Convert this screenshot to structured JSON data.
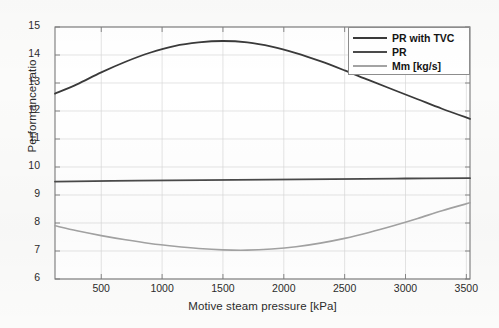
{
  "chart_data": {
    "type": "line",
    "title": "",
    "xlabel": "Motive steam pressure [kPa]",
    "ylabel": "Performance ratio",
    "xlim": [
      120,
      3530
    ],
    "ylim": [
      6,
      15
    ],
    "xticks": [
      500,
      1000,
      1500,
      2000,
      2500,
      3000,
      3500
    ],
    "yticks": [
      6,
      7,
      8,
      9,
      10,
      11,
      12,
      13,
      14,
      15
    ],
    "grid": true,
    "legend_position": "upper right",
    "series": [
      {
        "name": "PR with TVC",
        "color": "#3a3a3a",
        "width": 1.8,
        "x": [
          120,
          300,
          500,
          700,
          900,
          1100,
          1300,
          1500,
          1700,
          1900,
          2100,
          2300,
          2500,
          2700,
          2900,
          3100,
          3300,
          3530
        ],
        "y": [
          12.62,
          12.95,
          13.38,
          13.76,
          14.08,
          14.32,
          14.45,
          14.5,
          14.45,
          14.3,
          14.07,
          13.78,
          13.45,
          13.1,
          12.76,
          12.42,
          12.08,
          11.72
        ]
      },
      {
        "name": "PR",
        "color": "#4a4a4a",
        "width": 1.8,
        "x": [
          120,
          800,
          1600,
          2400,
          3000,
          3530
        ],
        "y": [
          9.48,
          9.51,
          9.54,
          9.57,
          9.59,
          9.6
        ]
      },
      {
        "name": "Mm [kg/s]",
        "color": "#a3a3a3",
        "width": 1.6,
        "x": [
          120,
          300,
          500,
          700,
          900,
          1100,
          1300,
          1500,
          1700,
          1900,
          2100,
          2300,
          2500,
          2700,
          2900,
          3100,
          3300,
          3530
        ],
        "y": [
          7.9,
          7.72,
          7.55,
          7.4,
          7.27,
          7.17,
          7.09,
          7.04,
          7.03,
          7.07,
          7.15,
          7.28,
          7.45,
          7.66,
          7.9,
          8.16,
          8.44,
          8.72
        ]
      }
    ]
  },
  "legend": {
    "entries": [
      {
        "label": "PR with TVC",
        "color": "#3a3a3a"
      },
      {
        "label": "PR",
        "color": "#4a4a4a"
      },
      {
        "label": "Mm [kg/s]",
        "color": "#a3a3a3"
      }
    ]
  },
  "axes": {
    "ylabel": "Performance ratio",
    "xlabel": "Motive steam pressure [kPa]",
    "ytick_labels": [
      "15",
      "14",
      "13",
      "12",
      "11",
      "10",
      "9",
      "8",
      "7",
      "6"
    ],
    "xtick_labels": [
      "500",
      "1000",
      "1500",
      "2000",
      "2500",
      "3000",
      "3500"
    ]
  },
  "style": {
    "background": "#fbfbfa",
    "plot_background": "#ffffff",
    "axis_color": "#7a7a7a",
    "grid_color": "#d8d8d8",
    "text_color": "#2b2b2b"
  }
}
